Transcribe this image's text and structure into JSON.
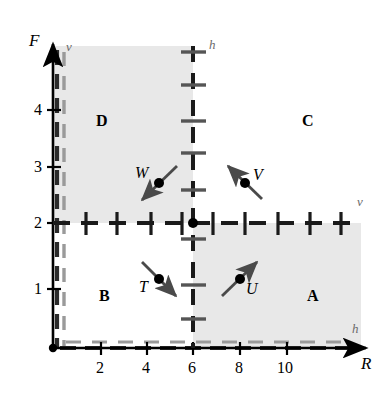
{
  "figure": {
    "type": "phase-plane-direction-field",
    "x_axis": {
      "label": "R",
      "ticks": [
        2,
        4,
        6,
        8,
        10
      ],
      "min": 0,
      "max": 12.2
    },
    "y_axis": {
      "label": "F",
      "ticks": [
        1,
        2,
        3,
        4
      ],
      "min": 0,
      "max": 5.2
    }
  },
  "nullclines": [
    {
      "id": "vertical-nullcline",
      "label": "h",
      "orientation": "vertical",
      "value": 6,
      "label_top": "h",
      "label_bottom": null,
      "style": "dashed-with-ticks"
    },
    {
      "id": "horizontal-nullcline",
      "label": "v",
      "orientation": "horizontal",
      "value": 2,
      "label_right": "v",
      "style": "dashed-with-ticks"
    },
    {
      "id": "y-axis-nullcline",
      "label": "v",
      "orientation": "vertical",
      "value": 0,
      "label_top": "v",
      "style": "dashed"
    },
    {
      "id": "x-axis-nullcline",
      "label": "h",
      "orientation": "horizontal",
      "value": 0,
      "label_right": "h",
      "style": "dashed"
    }
  ],
  "equilibrium_point": {
    "x": 6,
    "y": 2,
    "label": ""
  },
  "regions": [
    {
      "name": "A",
      "x": 10.2,
      "y": 0.85,
      "shaded": true,
      "quadrant": "lower-right"
    },
    {
      "name": "B",
      "x": 2.3,
      "y": 0.85,
      "shaded": false,
      "quadrant": "lower-left"
    },
    {
      "name": "C",
      "x": 10.2,
      "y": 3.55,
      "shaded": false,
      "quadrant": "upper-right"
    },
    {
      "name": "D",
      "x": 2.35,
      "y": 3.55,
      "shaded": true,
      "quadrant": "upper-left"
    }
  ],
  "vectors": [
    {
      "name": "T",
      "x": 4.3,
      "y": 1.35,
      "direction_deg": -40,
      "label_side": "left",
      "description": "down-right"
    },
    {
      "name": "U",
      "x": 7.7,
      "y": 1.35,
      "direction_deg": 40,
      "label_side": "right",
      "description": "up-right"
    },
    {
      "name": "V",
      "x": 8.25,
      "y": 2.75,
      "direction_deg": 140,
      "label_side": "right",
      "description": "up-left"
    },
    {
      "name": "W",
      "x": 4.35,
      "y": 2.8,
      "direction_deg": -140,
      "label_side": "left",
      "description": "down-left"
    }
  ],
  "colors": {
    "shading": "#e8e8e8",
    "line": "#000000",
    "nullcline_label": "#6b6b6b",
    "tick_gray": "#7a7a7a"
  }
}
